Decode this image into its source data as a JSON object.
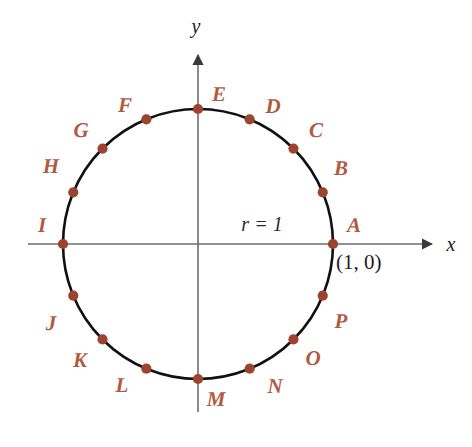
{
  "figure": {
    "background_color": "#ffffff",
    "width": 472,
    "height": 447
  },
  "colors": {
    "point_marker": "#9c4430",
    "point_label": "#b05a42",
    "curve": "#111111",
    "axis": "#6d6d6d",
    "annotation": "#2a2a2a"
  },
  "axes": {
    "x_label": "x",
    "y_label": "y",
    "origin": {
      "x": 198,
      "y": 244
    },
    "x_axis": {
      "x1": 28,
      "x2": 432,
      "y": 244,
      "arrow": "right"
    },
    "y_axis": {
      "y1": 55,
      "y2": 412,
      "x": 198,
      "arrow": "up"
    },
    "x_label_pos": {
      "x": 451,
      "y": 244
    },
    "y_label_pos": {
      "x": 196,
      "y": 26
    }
  },
  "circle": {
    "center_x": 198,
    "center_y": 244,
    "radius_px": 135,
    "radius_value": 1,
    "radius_annotation": "r = 1",
    "radius_annotation_pos": {
      "x": 262,
      "y": 224
    },
    "stroke_width": 2.6
  },
  "annotations": [
    {
      "name": "point-a-coordinates",
      "text": "(1, 0)",
      "x": 336,
      "y": 262
    }
  ],
  "chart_data": {
    "type": "scatter",
    "xlabel": "x",
    "ylabel": "y",
    "xlim": [
      -1.5,
      1.7
    ],
    "ylim": [
      -1.5,
      1.4
    ],
    "grid": false,
    "legend": null,
    "curve": {
      "name": "unit circle",
      "equation": "x^2 + y^2 = 1",
      "radius": 1
    },
    "angle_step_degrees": 22.5,
    "points": [
      {
        "label": "A",
        "angle_deg": 0,
        "x": 1.0,
        "y": 0.0,
        "px": 333,
        "py": 244,
        "lx": 354,
        "ly": 225
      },
      {
        "label": "B",
        "angle_deg": 22.5,
        "x": 0.9239,
        "y": 0.3827,
        "px": 323,
        "py": 192,
        "lx": 341,
        "ly": 168
      },
      {
        "label": "C",
        "angle_deg": 45,
        "x": 0.7071,
        "y": 0.7071,
        "px": 293,
        "py": 148,
        "lx": 316,
        "ly": 130
      },
      {
        "label": "D",
        "angle_deg": 67.5,
        "x": 0.3827,
        "y": 0.9239,
        "px": 250,
        "py": 119,
        "lx": 273,
        "ly": 106
      },
      {
        "label": "E",
        "angle_deg": 90,
        "x": 0.0,
        "y": 1.0,
        "px": 198,
        "py": 109,
        "lx": 219,
        "ly": 94
      },
      {
        "label": "F",
        "angle_deg": 112.5,
        "x": -0.3827,
        "y": 0.9239,
        "px": 146,
        "py": 119,
        "lx": 125,
        "ly": 105
      },
      {
        "label": "G",
        "angle_deg": 135,
        "x": -0.7071,
        "y": 0.7071,
        "px": 103,
        "py": 148,
        "lx": 81,
        "ly": 130
      },
      {
        "label": "H",
        "angle_deg": 157.5,
        "x": -0.9239,
        "y": 0.3827,
        "px": 73,
        "py": 192,
        "lx": 51,
        "ly": 166
      },
      {
        "label": "I",
        "angle_deg": 180,
        "x": -1.0,
        "y": 0.0,
        "px": 63,
        "py": 244,
        "lx": 42,
        "ly": 225
      },
      {
        "label": "J",
        "angle_deg": 202.5,
        "x": -0.9239,
        "y": -0.3827,
        "px": 73,
        "py": 296,
        "lx": 51,
        "ly": 323
      },
      {
        "label": "K",
        "angle_deg": 225,
        "x": -0.7071,
        "y": -0.7071,
        "px": 103,
        "py": 340,
        "lx": 80,
        "ly": 360
      },
      {
        "label": "L",
        "angle_deg": 247.5,
        "x": -0.3827,
        "y": -0.9239,
        "px": 146,
        "py": 369,
        "lx": 122,
        "ly": 385
      },
      {
        "label": "M",
        "angle_deg": 270,
        "x": 0.0,
        "y": -1.0,
        "px": 198,
        "py": 379,
        "lx": 216,
        "ly": 399
      },
      {
        "label": "N",
        "angle_deg": 292.5,
        "x": 0.3827,
        "y": -0.9239,
        "px": 250,
        "py": 369,
        "lx": 275,
        "ly": 386
      },
      {
        "label": "O",
        "angle_deg": 315,
        "x": 0.7071,
        "y": -0.7071,
        "px": 293,
        "py": 340,
        "lx": 313,
        "ly": 358
      },
      {
        "label": "P",
        "angle_deg": 337.5,
        "x": 0.9239,
        "y": -0.3827,
        "px": 323,
        "py": 296,
        "lx": 341,
        "ly": 321
      }
    ]
  }
}
